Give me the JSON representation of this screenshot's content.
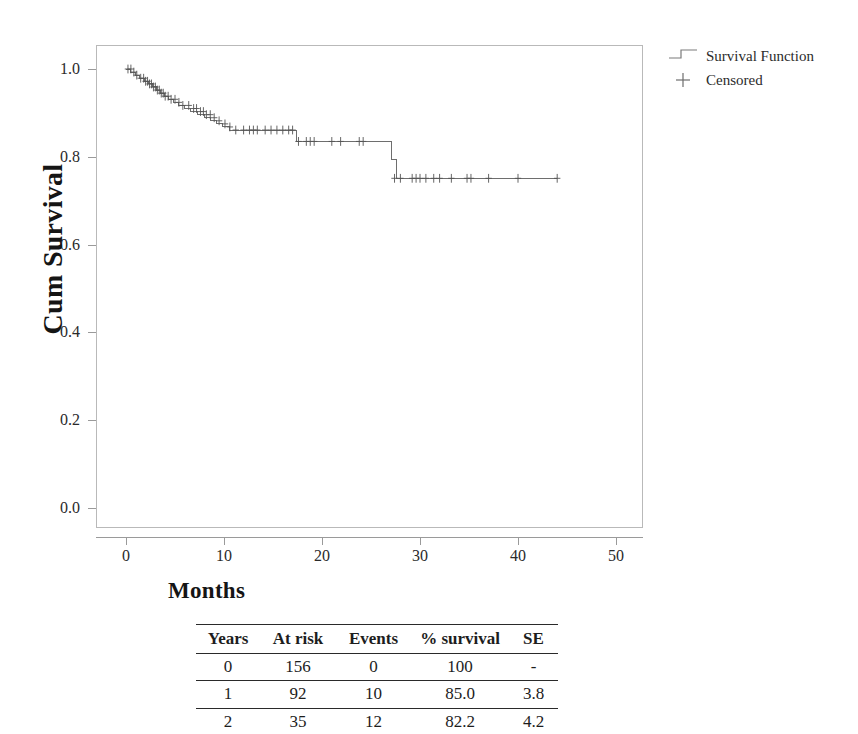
{
  "chart_data": {
    "type": "line",
    "title": "",
    "xlabel": "Months",
    "ylabel": "Cum Survival",
    "xlim": [
      -5,
      55
    ],
    "ylim": [
      -0.05,
      1.06
    ],
    "xticks": [
      "0",
      "10",
      "20",
      "30",
      "40",
      "50"
    ],
    "xtick_values": [
      0,
      10,
      20,
      30,
      40,
      50
    ],
    "yticks": [
      "0.0",
      "0.2",
      "0.4",
      "0.6",
      "0.8",
      "1.0"
    ],
    "ytick_values": [
      0.0,
      0.2,
      0.4,
      0.6,
      0.8,
      1.0
    ],
    "grid": false,
    "legend_position": "right-top",
    "series": [
      {
        "name": "Survival Function",
        "style": "step",
        "color": "#6e6e6e",
        "points": [
          [
            0.0,
            1.0
          ],
          [
            0.5,
            0.993
          ],
          [
            1.0,
            0.986
          ],
          [
            1.4,
            0.979
          ],
          [
            1.9,
            0.972
          ],
          [
            2.3,
            0.966
          ],
          [
            2.7,
            0.959
          ],
          [
            3.1,
            0.952
          ],
          [
            3.5,
            0.945
          ],
          [
            3.9,
            0.938
          ],
          [
            4.3,
            0.931
          ],
          [
            4.8,
            0.924
          ],
          [
            5.4,
            0.917
          ],
          [
            6.0,
            0.91
          ],
          [
            6.6,
            0.903
          ],
          [
            7.3,
            0.896
          ],
          [
            8.0,
            0.889
          ],
          [
            8.6,
            0.882
          ],
          [
            9.2,
            0.875
          ],
          [
            9.8,
            0.868
          ],
          [
            10.6,
            0.861
          ],
          [
            17.2,
            0.861
          ],
          [
            17.4,
            0.835
          ],
          [
            26.9,
            0.835
          ],
          [
            27.1,
            0.793
          ],
          [
            27.6,
            0.751
          ],
          [
            44.0,
            0.751
          ]
        ]
      }
    ],
    "censored": {
      "name": "Censored",
      "marker": "plus",
      "color": "#555555",
      "points": [
        [
          0.2,
          1.0
        ],
        [
          0.5,
          1.0
        ],
        [
          0.8,
          0.993
        ],
        [
          1.1,
          0.986
        ],
        [
          1.5,
          0.979
        ],
        [
          1.8,
          0.979
        ],
        [
          2.0,
          0.972
        ],
        [
          2.2,
          0.972
        ],
        [
          2.4,
          0.966
        ],
        [
          2.6,
          0.966
        ],
        [
          2.8,
          0.959
        ],
        [
          3.0,
          0.959
        ],
        [
          3.2,
          0.952
        ],
        [
          3.4,
          0.952
        ],
        [
          3.6,
          0.945
        ],
        [
          3.8,
          0.945
        ],
        [
          4.0,
          0.938
        ],
        [
          4.3,
          0.938
        ],
        [
          4.6,
          0.931
        ],
        [
          5.0,
          0.931
        ],
        [
          5.4,
          0.924
        ],
        [
          5.8,
          0.917
        ],
        [
          6.4,
          0.917
        ],
        [
          6.9,
          0.91
        ],
        [
          7.2,
          0.91
        ],
        [
          7.6,
          0.903
        ],
        [
          7.9,
          0.903
        ],
        [
          8.2,
          0.896
        ],
        [
          8.6,
          0.896
        ],
        [
          9.0,
          0.889
        ],
        [
          9.5,
          0.882
        ],
        [
          10.1,
          0.875
        ],
        [
          10.6,
          0.868
        ],
        [
          11.2,
          0.861
        ],
        [
          12.0,
          0.861
        ],
        [
          12.6,
          0.861
        ],
        [
          13.0,
          0.861
        ],
        [
          13.4,
          0.861
        ],
        [
          14.2,
          0.861
        ],
        [
          14.8,
          0.861
        ],
        [
          15.4,
          0.861
        ],
        [
          16.0,
          0.861
        ],
        [
          16.6,
          0.861
        ],
        [
          17.0,
          0.861
        ],
        [
          17.6,
          0.835
        ],
        [
          18.4,
          0.835
        ],
        [
          18.8,
          0.835
        ],
        [
          19.2,
          0.835
        ],
        [
          21.0,
          0.835
        ],
        [
          21.9,
          0.835
        ],
        [
          23.8,
          0.835
        ],
        [
          24.2,
          0.835
        ],
        [
          27.4,
          0.751
        ],
        [
          28.0,
          0.751
        ],
        [
          29.2,
          0.751
        ],
        [
          29.6,
          0.751
        ],
        [
          30.0,
          0.751
        ],
        [
          30.6,
          0.751
        ],
        [
          31.4,
          0.751
        ],
        [
          32.0,
          0.751
        ],
        [
          33.2,
          0.751
        ],
        [
          34.8,
          0.751
        ],
        [
          35.2,
          0.751
        ],
        [
          37.0,
          0.751
        ],
        [
          40.0,
          0.751
        ],
        [
          44.0,
          0.751
        ]
      ]
    }
  },
  "legend": {
    "items": [
      {
        "label": "Survival Function",
        "symbol": "step-line"
      },
      {
        "label": "Censored",
        "symbol": "plus-marker"
      }
    ]
  },
  "risk_table": {
    "headers": [
      "Years",
      "At risk",
      "Events",
      "% survival",
      "SE"
    ],
    "rows": [
      [
        "0",
        "156",
        "0",
        "100",
        "-"
      ],
      [
        "1",
        "92",
        "10",
        "85.0",
        "3.8"
      ],
      [
        "2",
        "35",
        "12",
        "82.2",
        "4.2"
      ]
    ]
  },
  "colors": {
    "curve": "#6e6e6e",
    "censor": "#555555",
    "frame": "#b9b9b9",
    "axis": "#9a9a9a",
    "text": "#1d1d1d",
    "background": "#ffffff"
  }
}
